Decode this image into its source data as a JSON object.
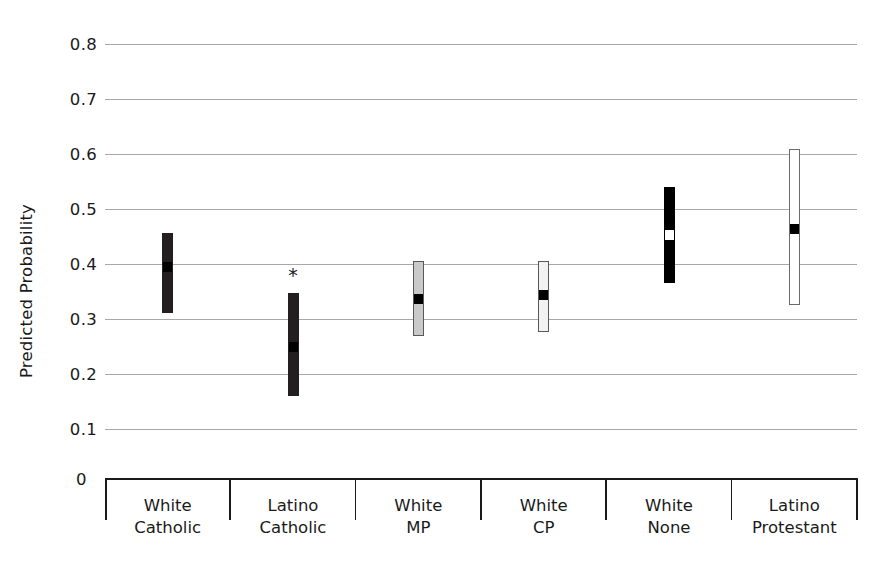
{
  "chart_data": {
    "type": "bar",
    "title": "",
    "subtitle": "",
    "xlabel": "",
    "ylabel": "Predicted Probability",
    "ylim": [
      0,
      0.8
    ],
    "ytick_labels": [
      "0.8",
      "0.7",
      "0.6",
      "0.5",
      "0.4",
      "0.3",
      "0.2",
      "0.1"
    ],
    "ytick_values": [
      0.8,
      0.7,
      0.6,
      0.5,
      0.4,
      0.3,
      0.2,
      0.1
    ],
    "origin_label": "0",
    "grid": true,
    "legend": "none",
    "categories": [
      "White Catholic",
      "Latino Catholic",
      "White MP",
      "White CP",
      "White None",
      "Latino Protestant"
    ],
    "category_lines": [
      [
        "White",
        "Catholic"
      ],
      [
        "Latino",
        "Catholic"
      ],
      [
        "White",
        "MP"
      ],
      [
        "White",
        "CP"
      ],
      [
        "White",
        "None"
      ],
      [
        "Latino",
        "Protestant"
      ]
    ],
    "values": [
      0.397,
      0.251,
      0.338,
      0.345,
      0.454,
      0.465
    ],
    "ci_low": [
      0.311,
      0.16,
      0.27,
      0.277,
      0.365,
      0.326
    ],
    "ci_high": [
      0.457,
      0.348,
      0.405,
      0.405,
      0.54,
      0.609
    ],
    "bar_fill_styles": [
      "dark",
      "dark",
      "gray",
      "light",
      "black",
      "white"
    ],
    "marker_styles": [
      "black",
      "black",
      "black",
      "black",
      "white",
      "black"
    ],
    "annotations": [
      {
        "category": "Latino Catholic",
        "text": "*",
        "meaning": "significance-marker"
      }
    ],
    "colors": {
      "dark": "#231f20",
      "black": "#000000",
      "gray": "#c9c9c9",
      "light": "#f2f2f2",
      "white": "#ffffff",
      "gridline": "#a8a8a8",
      "axis": "#1a1a1a",
      "text": "#1a1a1a"
    }
  }
}
